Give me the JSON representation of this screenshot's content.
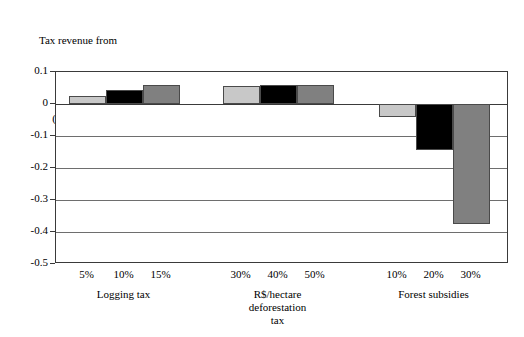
{
  "chart_data": {
    "type": "bar",
    "title": "",
    "ylabel": "Tax revenue from policy (billion R$)",
    "ylabel_lines": [
      "Tax revenue from",
      "policy",
      "(billion R$)"
    ],
    "xlabel": "",
    "ylim": [
      -0.5,
      0.1
    ],
    "ytick_labels": [
      "0.1",
      "0",
      "-0.1",
      "-0.2",
      "-0.3",
      "-0.4",
      "-0.5"
    ],
    "ytick_values": [
      0.1,
      0,
      -0.1,
      -0.2,
      -0.3,
      -0.4,
      -0.5
    ],
    "grid": true,
    "legend": "none",
    "groups": [
      {
        "name": "Logging tax",
        "label_lines": [
          "Logging tax"
        ],
        "categories": [
          "5%",
          "10%",
          "15%"
        ],
        "values": [
          0.025,
          0.045,
          0.06
        ],
        "colors": [
          "#c8c8c8",
          "#000000",
          "#808080"
        ]
      },
      {
        "name": "R$/hectare deforestation tax",
        "label_lines": [
          "R$/hectare",
          "deforestation",
          "tax"
        ],
        "categories": [
          "30%",
          "40%",
          "50%"
        ],
        "values": [
          0.055,
          0.06,
          0.06
        ],
        "colors": [
          "#c8c8c8",
          "#000000",
          "#808080"
        ]
      },
      {
        "name": "Forest subsidies",
        "label_lines": [
          "Forest subsidies"
        ],
        "categories": [
          "10%",
          "20%",
          "30%"
        ],
        "values": [
          -0.04,
          -0.145,
          -0.375
        ],
        "colors": [
          "#c8c8c8",
          "#000000",
          "#808080"
        ]
      }
    ],
    "categories": [
      "5%",
      "10%",
      "15%",
      "30%",
      "40%",
      "50%",
      "10%",
      "20%",
      "30%"
    ],
    "values": [
      0.025,
      0.045,
      0.06,
      0.055,
      0.06,
      0.06,
      -0.04,
      -0.145,
      -0.375
    ],
    "colors": {
      "series_light": "#c8c8c8",
      "series_black": "#000000",
      "series_gray": "#808080",
      "axis": "#3a3a3a",
      "grid": "#6e6e6e",
      "background": "#ffffff"
    }
  }
}
